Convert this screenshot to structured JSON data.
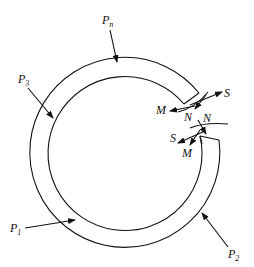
{
  "diagram": {
    "type": "free-body diagram of cut ring",
    "loads": [
      {
        "id": "Pn",
        "base": "P",
        "sub": "n"
      },
      {
        "id": "P3",
        "base": "P",
        "sub": "3"
      },
      {
        "id": "P1",
        "base": "P",
        "sub": "1"
      },
      {
        "id": "P2",
        "base": "P",
        "sub": "2"
      }
    ],
    "cut_upper": {
      "moment": "M",
      "shear": "S",
      "normal": "N"
    },
    "cut_lower": {
      "moment": "M",
      "shear": "S",
      "normal": "N"
    }
  }
}
